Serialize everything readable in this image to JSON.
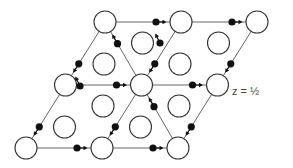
{
  "label": "z = ½",
  "lattice_nodes": [
    {
      "id": "A",
      "row": 0,
      "col": 0
    },
    {
      "id": "B",
      "row": 0,
      "col": 1
    },
    {
      "id": "C",
      "row": 0,
      "col": 2
    },
    {
      "id": "D",
      "row": 1,
      "col": 0
    },
    {
      "id": "E",
      "row": 1,
      "col": 1
    },
    {
      "id": "F",
      "row": 1,
      "col": 2
    },
    {
      "id": "G",
      "row": 2,
      "col": 0
    },
    {
      "id": "H",
      "row": 2,
      "col": 1
    },
    {
      "id": "I",
      "row": 2,
      "col": 2
    }
  ],
  "edges": [
    [
      "A",
      "B"
    ],
    [
      "B",
      "C"
    ],
    [
      "D",
      "E"
    ],
    [
      "E",
      "F"
    ],
    [
      "G",
      "H"
    ],
    [
      "H",
      "I"
    ],
    [
      "A",
      "D"
    ],
    [
      "B",
      "E"
    ],
    [
      "C",
      "F"
    ],
    [
      "D",
      "G"
    ],
    [
      "E",
      "H"
    ],
    [
      "F",
      "I"
    ],
    [
      "A",
      "E"
    ],
    [
      "E",
      "I"
    ]
  ],
  "displaced_atoms": [
    {
      "edge": [
        "A",
        "B"
      ],
      "toward": "B"
    },
    {
      "edge": [
        "B",
        "C"
      ],
      "toward": "C"
    },
    {
      "edge": [
        "D",
        "E"
      ],
      "toward": "E"
    },
    {
      "edge": [
        "E",
        "F"
      ],
      "toward": "F"
    },
    {
      "edge": [
        "G",
        "H"
      ],
      "toward": "H"
    },
    {
      "edge": [
        "H",
        "I"
      ],
      "toward": "I"
    },
    {
      "edge": [
        "A",
        "D"
      ],
      "toward": "D"
    },
    {
      "edge": [
        "B",
        "E"
      ],
      "toward": "E"
    },
    {
      "edge": [
        "C",
        "F"
      ],
      "toward": "F"
    },
    {
      "edge": [
        "D",
        "G"
      ],
      "toward": "G"
    },
    {
      "edge": [
        "E",
        "H"
      ],
      "toward": "H"
    },
    {
      "edge": [
        "F",
        "I"
      ],
      "toward": "I"
    },
    {
      "edge": [
        "A",
        "E"
      ],
      "toward": "A"
    },
    {
      "edge": [
        "E",
        "I"
      ],
      "toward": "E"
    }
  ],
  "free_atoms": [
    {
      "cell": "upper-right",
      "arrow": "up-left"
    },
    {
      "cell": "lower-left",
      "arrow": "up-left"
    }
  ],
  "interior_circle_count": 8
}
